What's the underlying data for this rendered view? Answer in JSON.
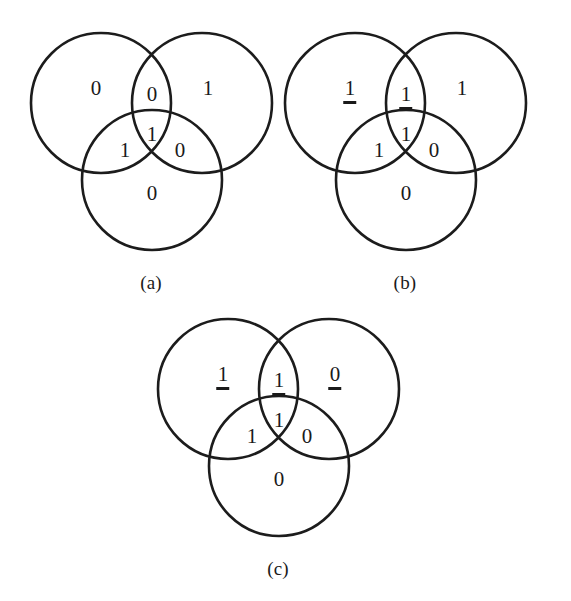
{
  "figure": {
    "type": "venn-diagram-set",
    "background_color": "#ffffff",
    "stroke_color": "#1c1c1c",
    "text_color": "#1a1a1a",
    "panels": [
      {
        "id": "a",
        "caption": "(a)",
        "geometry": {
          "left_circle": {
            "cx": 95,
            "cy": 101,
            "r": 70
          },
          "right_circle": {
            "cx": 196,
            "cy": 101,
            "r": 70
          },
          "bottom_circle": {
            "cx": 146,
            "cy": 178,
            "r": 70
          }
        },
        "regions": [
          {
            "name": "left-only",
            "value": "0",
            "underlined": false,
            "x": 90,
            "y": 87
          },
          {
            "name": "left-right-overlap",
            "value": "0",
            "underlined": false,
            "x": 146,
            "y": 93
          },
          {
            "name": "right-only",
            "value": "1",
            "underlined": false,
            "x": 202,
            "y": 87
          },
          {
            "name": "center-all-three",
            "value": "1",
            "underlined": false,
            "x": 146,
            "y": 133
          },
          {
            "name": "left-bottom-overlap",
            "value": "1",
            "underlined": false,
            "x": 119,
            "y": 149
          },
          {
            "name": "right-bottom-overlap",
            "value": "0",
            "underlined": false,
            "x": 174,
            "y": 149
          },
          {
            "name": "bottom-only",
            "value": "0",
            "underlined": false,
            "x": 146,
            "y": 192
          }
        ]
      },
      {
        "id": "b",
        "caption": "(b)",
        "geometry": {
          "left_circle": {
            "cx": 95,
            "cy": 101,
            "r": 70
          },
          "right_circle": {
            "cx": 196,
            "cy": 101,
            "r": 70
          },
          "bottom_circle": {
            "cx": 146,
            "cy": 178,
            "r": 70
          }
        },
        "regions": [
          {
            "name": "left-only",
            "value": "1",
            "underlined": true,
            "x": 90,
            "y": 87
          },
          {
            "name": "left-right-overlap",
            "value": "1",
            "underlined": true,
            "x": 146,
            "y": 93
          },
          {
            "name": "right-only",
            "value": "1",
            "underlined": false,
            "x": 202,
            "y": 87
          },
          {
            "name": "center-all-three",
            "value": "1",
            "underlined": false,
            "x": 146,
            "y": 133
          },
          {
            "name": "left-bottom-overlap",
            "value": "1",
            "underlined": false,
            "x": 119,
            "y": 149
          },
          {
            "name": "right-bottom-overlap",
            "value": "0",
            "underlined": false,
            "x": 174,
            "y": 149
          },
          {
            "name": "bottom-only",
            "value": "0",
            "underlined": false,
            "x": 146,
            "y": 192
          }
        ]
      },
      {
        "id": "c",
        "caption": "(c)",
        "geometry": {
          "left_circle": {
            "cx": 95,
            "cy": 101,
            "r": 70
          },
          "right_circle": {
            "cx": 196,
            "cy": 101,
            "r": 70
          },
          "bottom_circle": {
            "cx": 146,
            "cy": 178,
            "r": 70
          }
        },
        "regions": [
          {
            "name": "left-only",
            "value": "1",
            "underlined": true,
            "x": 90,
            "y": 87
          },
          {
            "name": "left-right-overlap",
            "value": "1",
            "underlined": true,
            "x": 146,
            "y": 93
          },
          {
            "name": "right-only",
            "value": "0",
            "underlined": true,
            "x": 202,
            "y": 87
          },
          {
            "name": "center-all-three",
            "value": "1",
            "underlined": false,
            "x": 146,
            "y": 133
          },
          {
            "name": "left-bottom-overlap",
            "value": "1",
            "underlined": false,
            "x": 119,
            "y": 149
          },
          {
            "name": "right-bottom-overlap",
            "value": "0",
            "underlined": false,
            "x": 174,
            "y": 149
          },
          {
            "name": "bottom-only",
            "value": "0",
            "underlined": false,
            "x": 146,
            "y": 192
          }
        ]
      }
    ]
  }
}
